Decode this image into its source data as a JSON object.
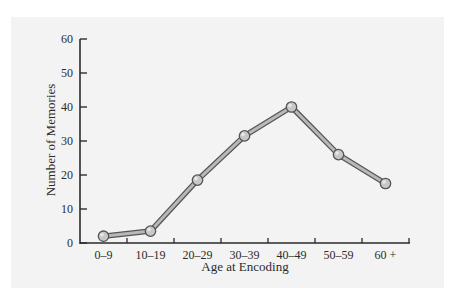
{
  "chart_data": {
    "type": "line",
    "title": "",
    "xlabel": "Age at Encoding",
    "ylabel": "Number of Memories",
    "categories": [
      "0–9",
      "10–19",
      "20–29",
      "30–39",
      "40–49",
      "50–59",
      "60 +"
    ],
    "series": [
      {
        "name": "Memories",
        "values": [
          2,
          3.5,
          18.5,
          31.5,
          40,
          26,
          17.5
        ]
      }
    ],
    "ylim": [
      0,
      60
    ],
    "yticks": [
      0,
      10,
      20,
      30,
      40,
      50,
      60
    ],
    "grid": false,
    "legend": null
  },
  "colors": {
    "panel_background": "#f3f3f3",
    "axis": "#2b2b2b",
    "line_outline": "#555555",
    "line_fill": "#b8b8b8",
    "marker_fill": "#c8c8c8",
    "marker_outline": "#555555"
  }
}
